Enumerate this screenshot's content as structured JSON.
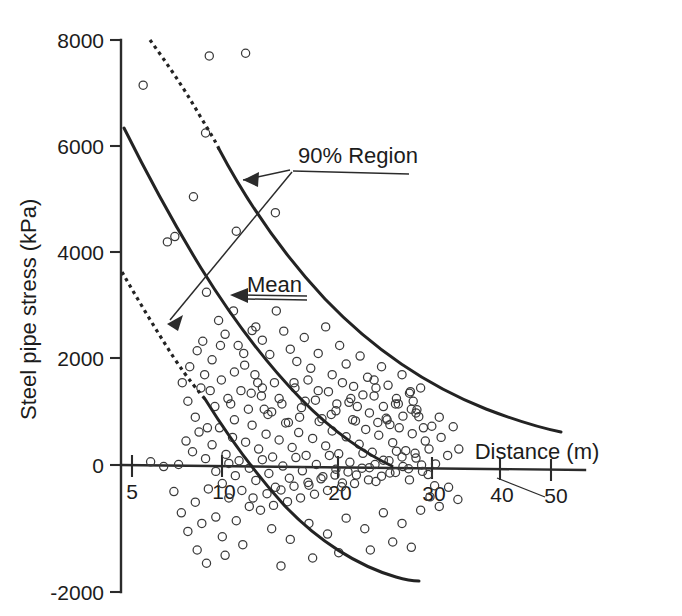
{
  "chart_data": {
    "type": "scatter",
    "title": "",
    "xlabel": "Distance (m)",
    "ylabel": "Steel pipe stress (kPa)",
    "xlim": [
      3.2,
      52
    ],
    "ylim": [
      -2000,
      8000
    ],
    "grid": false,
    "legend_position": "inline-annotations",
    "xticks": [
      5,
      10,
      20,
      30,
      40,
      50
    ],
    "xtick_labels": [
      "5",
      "10",
      "20",
      "30",
      "40",
      "50"
    ],
    "yticks": [
      -2000,
      0,
      2000,
      4000,
      6000,
      8000
    ],
    "ytick_labels": [
      "-2000",
      "0",
      "2000",
      "4000",
      "6000",
      "8000"
    ],
    "annotations": [
      {
        "name": "90% Region",
        "text": "90% Region",
        "points_to": [
          "upper 90% bound curve",
          "lower 90% bound curve"
        ]
      },
      {
        "name": "Mean",
        "text": "Mean",
        "points_to": [
          "mean curve"
        ]
      }
    ],
    "series": [
      {
        "name": "upper-90-percent-bound",
        "style": "dashed-then-solid",
        "comment": "dashed from x=5.6 to x=9.5, solid thereafter",
        "x": [
          5.6,
          6.3,
          7.0,
          7.8,
          8.6,
          9.5,
          10.5,
          11.6,
          12.8,
          14.2,
          15.8,
          17.6,
          19.6,
          21.8,
          24.2,
          27.0,
          30.0,
          33.4,
          37.0,
          41.0,
          44.2
        ],
        "y": [
          8000,
          7720,
          7420,
          7090,
          6740,
          6370,
          5990,
          5600,
          5210,
          4820,
          4440,
          4080,
          3740,
          3430,
          3150,
          2880,
          2650,
          2450,
          2290,
          2150,
          2060
        ]
      },
      {
        "name": "mean",
        "style": "solid",
        "x": [
          4.4,
          5.0,
          5.7,
          6.5,
          7.4,
          8.4,
          9.5,
          10.7,
          12.0,
          13.5,
          15.2,
          17.0,
          19.0,
          21.2,
          23.6,
          26.2,
          29.0,
          32.0,
          34.6
        ],
        "y": [
          6400,
          6050,
          5650,
          5220,
          4760,
          4290,
          3820,
          3360,
          2910,
          2480,
          2080,
          1720,
          1400,
          1120,
          880,
          670,
          490,
          330,
          220
        ]
      },
      {
        "name": "lower-90-percent-bound",
        "style": "dashed-then-solid",
        "comment": "dashed from x=4.4 to x=8.4, solid thereafter",
        "x": [
          4.4,
          4.9,
          5.5,
          6.2,
          7.0,
          7.8,
          8.4,
          9.4,
          10.5,
          11.8,
          13.2,
          14.8,
          16.6,
          18.6,
          20.8,
          23.2,
          25.8,
          28.6,
          31.0
        ],
        "y": [
          3950,
          3660,
          3320,
          2930,
          2500,
          2060,
          1760,
          1230,
          690,
          120,
          -420,
          -930,
          -1380,
          -1700,
          -1930,
          -2080,
          -2170,
          -2230,
          -2250
        ]
      },
      {
        "name": "observations",
        "style": "open-circles",
        "marker": "o",
        "count": 452,
        "comment": "scattered field observations of steel pipe stress vs distance; dense cluster between 14 and 36 m near 0 kPa, sparse high outliers between 5 and 22 m",
        "points": [
          [
            6.2,
            7150
          ],
          [
            13.3,
            7700
          ],
          [
            17.2,
            7750
          ],
          [
            12.9,
            6250
          ],
          [
            11.6,
            5050
          ],
          [
            20.4,
            4750
          ],
          [
            8.8,
            4200
          ],
          [
            9.6,
            4300
          ],
          [
            16.2,
            4400
          ],
          [
            13.0,
            3250
          ],
          [
            15.9,
            2900
          ],
          [
            17.9,
            2530
          ],
          [
            10.4,
            1550
          ],
          [
            12.0,
            2150
          ],
          [
            12.6,
            2330
          ],
          [
            13.6,
            1980
          ],
          [
            14.3,
            2720
          ],
          [
            15.0,
            2460
          ],
          [
            16.4,
            2250
          ],
          [
            17.1,
            1880
          ],
          [
            18.3,
            2600
          ],
          [
            19.0,
            2350
          ],
          [
            19.8,
            2080
          ],
          [
            20.5,
            2900
          ],
          [
            21.3,
            2520
          ],
          [
            22.0,
            2180
          ],
          [
            22.7,
            1950
          ],
          [
            23.5,
            2400
          ],
          [
            24.2,
            1820
          ],
          [
            25.0,
            2100
          ],
          [
            25.8,
            2600
          ],
          [
            26.5,
            1700
          ],
          [
            27.3,
            2250
          ],
          [
            28.0,
            1900
          ],
          [
            28.8,
            1480
          ],
          [
            29.5,
            2050
          ],
          [
            30.3,
            1650
          ],
          [
            31.0,
            1300
          ],
          [
            31.8,
            1850
          ],
          [
            32.5,
            1500
          ],
          [
            33.3,
            1150
          ],
          [
            34.0,
            1700
          ],
          [
            34.8,
            1350
          ],
          [
            35.5,
            980
          ],
          [
            11.0,
            1200
          ],
          [
            11.8,
            900
          ],
          [
            12.4,
            1450
          ],
          [
            13.1,
            700
          ],
          [
            13.9,
            1100
          ],
          [
            14.6,
            1600
          ],
          [
            15.3,
            1250
          ],
          [
            16.0,
            850
          ],
          [
            16.7,
            1400
          ],
          [
            17.5,
            1050
          ],
          [
            18.2,
            1700
          ],
          [
            18.9,
            1300
          ],
          [
            19.6,
            950
          ],
          [
            20.3,
            1550
          ],
          [
            21.1,
            1150
          ],
          [
            21.8,
            800
          ],
          [
            22.5,
            1450
          ],
          [
            23.2,
            1080
          ],
          [
            23.9,
            1600
          ],
          [
            24.7,
            1220
          ],
          [
            25.4,
            870
          ],
          [
            26.1,
            1380
          ],
          [
            26.9,
            1020
          ],
          [
            27.6,
            1550
          ],
          [
            28.3,
            1180
          ],
          [
            29.0,
            830
          ],
          [
            29.8,
            1320
          ],
          [
            30.5,
            980
          ],
          [
            31.2,
            1450
          ],
          [
            32.0,
            1100
          ],
          [
            32.7,
            760
          ],
          [
            33.4,
            1250
          ],
          [
            34.1,
            920
          ],
          [
            34.9,
            1380
          ],
          [
            35.6,
            1040
          ],
          [
            36.3,
            700
          ],
          [
            10.8,
            450
          ],
          [
            11.5,
            250
          ],
          [
            12.2,
            620
          ],
          [
            12.9,
            120
          ],
          [
            13.6,
            380
          ],
          [
            14.4,
            700
          ],
          [
            15.1,
            200
          ],
          [
            15.8,
            520
          ],
          [
            16.5,
            80
          ],
          [
            17.2,
            430
          ],
          [
            17.9,
            750
          ],
          [
            18.6,
            300
          ],
          [
            19.4,
            580
          ],
          [
            20.1,
            150
          ],
          [
            20.8,
            470
          ],
          [
            21.5,
            790
          ],
          [
            22.2,
            330
          ],
          [
            22.9,
            610
          ],
          [
            23.7,
            180
          ],
          [
            24.4,
            500
          ],
          [
            25.1,
            820
          ],
          [
            25.8,
            360
          ],
          [
            26.5,
            640
          ],
          [
            27.2,
            210
          ],
          [
            28.0,
            530
          ],
          [
            28.7,
            850
          ],
          [
            29.4,
            390
          ],
          [
            30.1,
            670
          ],
          [
            30.8,
            240
          ],
          [
            31.5,
            560
          ],
          [
            32.3,
            880
          ],
          [
            33.0,
            420
          ],
          [
            33.7,
            700
          ],
          [
            34.4,
            270
          ],
          [
            35.1,
            590
          ],
          [
            35.8,
            910
          ],
          [
            36.5,
            450
          ],
          [
            37.2,
            730
          ],
          [
            14.0,
            -120
          ],
          [
            14.7,
            -350
          ],
          [
            15.4,
            30
          ],
          [
            16.1,
            -200
          ],
          [
            16.8,
            -480
          ],
          [
            17.6,
            -60
          ],
          [
            18.3,
            -290
          ],
          [
            19.0,
            100
          ],
          [
            19.7,
            -160
          ],
          [
            20.4,
            -420
          ],
          [
            21.2,
            -20
          ],
          [
            21.9,
            -250
          ],
          [
            22.6,
            140
          ],
          [
            23.3,
            -110
          ],
          [
            24.0,
            -380
          ],
          [
            24.8,
            10
          ],
          [
            25.5,
            -220
          ],
          [
            26.2,
            180
          ],
          [
            26.9,
            -80
          ],
          [
            27.6,
            -340
          ],
          [
            28.4,
            50
          ],
          [
            29.1,
            -190
          ],
          [
            29.8,
            220
          ],
          [
            30.5,
            -50
          ],
          [
            31.2,
            -310
          ],
          [
            32.0,
            90
          ],
          [
            32.7,
            -150
          ],
          [
            33.4,
            260
          ],
          [
            34.1,
            -30
          ],
          [
            34.8,
            -280
          ],
          [
            35.5,
            130
          ],
          [
            36.2,
            -120
          ],
          [
            36.9,
            300
          ],
          [
            37.6,
            20
          ],
          [
            18.0,
            -620
          ],
          [
            18.8,
            -850
          ],
          [
            19.5,
            -540
          ],
          [
            20.2,
            -760
          ],
          [
            21.0,
            -470
          ],
          [
            21.7,
            -690
          ],
          [
            22.4,
            -400
          ],
          [
            23.1,
            -620
          ],
          [
            23.9,
            -330
          ],
          [
            24.6,
            -550
          ],
          [
            25.3,
            -260
          ],
          [
            26.0,
            -480
          ],
          [
            26.8,
            -190
          ],
          [
            27.5,
            -410
          ],
          [
            28.2,
            -130
          ],
          [
            28.9,
            -350
          ],
          [
            29.7,
            -60
          ],
          [
            30.4,
            -280
          ],
          [
            31.1,
            10
          ],
          [
            31.8,
            -210
          ],
          [
            32.6,
            80
          ],
          [
            33.3,
            -140
          ],
          [
            34.0,
            150
          ],
          [
            34.7,
            -70
          ],
          [
            35.4,
            220
          ],
          [
            36.1,
            0
          ],
          [
            36.8,
            -180
          ],
          [
            37.5,
            -390
          ],
          [
            9.5,
            -500
          ],
          [
            10.3,
            -900
          ],
          [
            11.0,
            -1250
          ],
          [
            11.8,
            -700
          ],
          [
            12.5,
            -1100
          ],
          [
            13.2,
            -450
          ],
          [
            14.0,
            -980
          ],
          [
            14.7,
            -1350
          ],
          [
            15.4,
            -620
          ],
          [
            16.2,
            -1050
          ],
          [
            16.9,
            -1500
          ],
          [
            17.6,
            -780
          ],
          [
            12.0,
            -1600
          ],
          [
            13.0,
            -1850
          ],
          [
            15.0,
            -1700
          ],
          [
            20.0,
            -1200
          ],
          [
            22.0,
            -1400
          ],
          [
            24.0,
            -1100
          ],
          [
            26.0,
            -1300
          ],
          [
            28.0,
            -1000
          ],
          [
            30.0,
            -1200
          ],
          [
            32.0,
            -900
          ],
          [
            34.0,
            -1100
          ],
          [
            36.0,
            -850
          ],
          [
            7.0,
            60
          ],
          [
            8.4,
            -30
          ],
          [
            10.0,
            10
          ],
          [
            19.2,
            1050
          ],
          [
            23.0,
            900
          ],
          [
            27.0,
            1150
          ],
          [
            31.4,
            800
          ],
          [
            35.0,
            1050
          ],
          [
            38.2,
            520
          ],
          [
            38.9,
            180
          ],
          [
            39.5,
            720
          ],
          [
            40.1,
            300
          ],
          [
            37.0,
            -600
          ],
          [
            38.0,
            -780
          ],
          [
            39.0,
            -420
          ],
          [
            40.0,
            -650
          ],
          [
            33.0,
            -1450
          ],
          [
            35.0,
            -1550
          ],
          [
            30.6,
            -1600
          ],
          [
            24.4,
            -1750
          ],
          [
            27.2,
            -1650
          ],
          [
            21.0,
            -1900
          ],
          [
            17.0,
            2100
          ],
          [
            18.5,
            1550
          ],
          [
            14.5,
            2250
          ],
          [
            16.0,
            1750
          ],
          [
            19.0,
            1450
          ],
          [
            20.8,
            1250
          ],
          [
            22.4,
            1550
          ],
          [
            25.0,
            1400
          ],
          [
            28.5,
            1250
          ],
          [
            31.0,
            1600
          ],
          [
            33.6,
            1150
          ],
          [
            36.0,
            1450
          ],
          [
            12.8,
            1700
          ],
          [
            11.2,
            1850
          ],
          [
            13.4,
            1400
          ],
          [
            15.6,
            1150
          ],
          [
            17.8,
            1350
          ],
          [
            20.0,
            1000
          ],
          [
            23.6,
            1200
          ],
          [
            26.4,
            950
          ],
          [
            29.2,
            1100
          ],
          [
            32.4,
            850
          ],
          [
            35.2,
            1200
          ],
          [
            38.0,
            900
          ]
        ]
      }
    ]
  },
  "axis": {
    "ylabel": "Steel pipe stress (kPa)",
    "xlabel": "Distance (m)"
  },
  "ytick_labels": {
    "t8000": "8000",
    "t6000": "6000",
    "t4000": "4000",
    "t2000": "2000",
    "t0": "0",
    "tm2000": "-2000"
  },
  "xtick_labels": {
    "t5": "5",
    "t10": "10",
    "t20": "20",
    "t30": "30",
    "t40": "40",
    "t50": "50"
  },
  "annotations": {
    "region": "90% Region",
    "mean": "Mean"
  },
  "colors": {
    "ink": "#232323",
    "marker": "#3a3a3a",
    "background": "#ffffff"
  }
}
